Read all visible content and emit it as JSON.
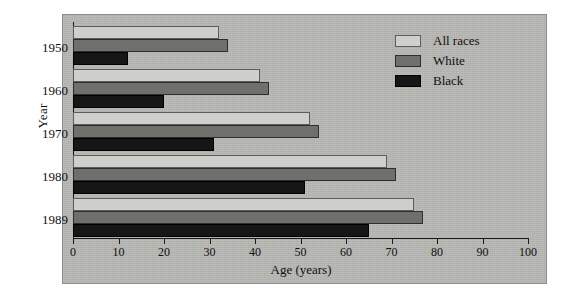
{
  "chart_data": {
    "type": "bar",
    "orientation": "horizontal",
    "title": "",
    "xlabel": "Age (years)",
    "ylabel": "Year",
    "categories": [
      "1950",
      "1960",
      "1970",
      "1980",
      "1989"
    ],
    "series": [
      {
        "name": "All races",
        "color": "#cfcfcb",
        "values": [
          32,
          41,
          52,
          69,
          75
        ]
      },
      {
        "name": "White",
        "color": "#6f6f6b",
        "values": [
          34,
          43,
          54,
          71,
          77
        ]
      },
      {
        "name": "Black",
        "color": "#161616",
        "values": [
          12,
          20,
          31,
          51,
          65
        ]
      }
    ],
    "xlim": [
      0,
      100
    ],
    "xticks": [
      0,
      10,
      20,
      30,
      40,
      50,
      60,
      70,
      80,
      90,
      100
    ],
    "xticklabels": [
      "0",
      "10",
      "20",
      "30",
      "40",
      "50",
      "60",
      "70",
      "80",
      "90",
      "100"
    ],
    "grid": false,
    "legend_position": "top-right",
    "plot_background": "#b8b8b4"
  },
  "axis": {
    "x_title": "Age (years)",
    "y_title": "Year"
  },
  "legend": {
    "entries": [
      {
        "label": "All races"
      },
      {
        "label": "White"
      },
      {
        "label": "Black"
      }
    ]
  }
}
